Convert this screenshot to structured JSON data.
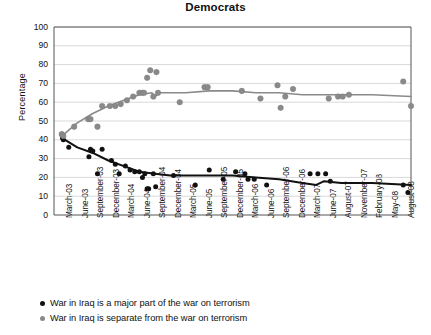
{
  "chart_data": {
    "type": "scatter",
    "title": "Democrats",
    "xlabel": "",
    "ylabel": "Percentage",
    "ylim": [
      0,
      100
    ],
    "ytick_step": 10,
    "yticks": [
      100,
      90,
      80,
      70,
      60,
      50,
      40,
      30,
      20,
      10,
      0
    ],
    "grid": true,
    "legend_position": "below",
    "categories": [
      "March-03",
      "June-03",
      "September-03",
      "December-03",
      "March-04",
      "June-04",
      "September-04",
      "December-04",
      "March-05",
      "June-05",
      "September-05",
      "December-05",
      "March-06",
      "June-06",
      "September-06",
      "December-06",
      "March-07",
      "June-07",
      "August-07",
      "November-07",
      "February-08",
      "May-08",
      "August-08"
    ],
    "series": [
      {
        "name": "War in Iraq is a major part of the war on terrorism",
        "color": "#111111",
        "marker": "circle",
        "points": [
          {
            "x": 0.0,
            "y": 43
          },
          {
            "x": 0.05,
            "y": 41
          },
          {
            "x": 0.1,
            "y": 40
          },
          {
            "x": 0.45,
            "y": 36
          },
          {
            "x": 1.75,
            "y": 31
          },
          {
            "x": 1.85,
            "y": 35
          },
          {
            "x": 2.0,
            "y": 34
          },
          {
            "x": 2.3,
            "y": 22
          },
          {
            "x": 2.6,
            "y": 35
          },
          {
            "x": 3.2,
            "y": 29
          },
          {
            "x": 3.45,
            "y": 27
          },
          {
            "x": 3.7,
            "y": 22
          },
          {
            "x": 4.1,
            "y": 26
          },
          {
            "x": 4.4,
            "y": 24
          },
          {
            "x": 4.7,
            "y": 23
          },
          {
            "x": 5.0,
            "y": 23
          },
          {
            "x": 5.2,
            "y": 20
          },
          {
            "x": 5.35,
            "y": 22
          },
          {
            "x": 5.5,
            "y": 14
          },
          {
            "x": 5.6,
            "y": 14
          },
          {
            "x": 5.9,
            "y": 22
          },
          {
            "x": 6.05,
            "y": 15
          },
          {
            "x": 7.2,
            "y": 21
          },
          {
            "x": 8.6,
            "y": 16
          },
          {
            "x": 9.5,
            "y": 24
          },
          {
            "x": 10.4,
            "y": 19
          },
          {
            "x": 11.2,
            "y": 23
          },
          {
            "x": 11.8,
            "y": 22
          },
          {
            "x": 12.0,
            "y": 19
          },
          {
            "x": 12.4,
            "y": 19
          },
          {
            "x": 13.2,
            "y": 16
          },
          {
            "x": 16.0,
            "y": 22
          },
          {
            "x": 16.5,
            "y": 22
          },
          {
            "x": 17.0,
            "y": 22
          },
          {
            "x": 17.3,
            "y": 18
          },
          {
            "x": 22.0,
            "y": 16
          },
          {
            "x": 22.3,
            "y": 12
          }
        ],
        "trend": [
          {
            "x": 0.0,
            "y": 41
          },
          {
            "x": 1.0,
            "y": 36
          },
          {
            "x": 2.0,
            "y": 33
          },
          {
            "x": 3.0,
            "y": 29
          },
          {
            "x": 4.0,
            "y": 26
          },
          {
            "x": 5.0,
            "y": 23
          },
          {
            "x": 6.0,
            "y": 22
          },
          {
            "x": 7.0,
            "y": 21
          },
          {
            "x": 8.0,
            "y": 21
          },
          {
            "x": 9.5,
            "y": 21
          },
          {
            "x": 11.0,
            "y": 21
          },
          {
            "x": 12.5,
            "y": 20
          },
          {
            "x": 14.0,
            "y": 19
          },
          {
            "x": 15.5,
            "y": 17
          },
          {
            "x": 16.4,
            "y": 16
          },
          {
            "x": 16.9,
            "y": 18
          },
          {
            "x": 18.0,
            "y": 17
          },
          {
            "x": 20.0,
            "y": 17
          },
          {
            "x": 22.5,
            "y": 16
          }
        ]
      },
      {
        "name": "War in Iraq is separate from the war on terrorism",
        "color": "#8a8a8a",
        "marker": "circle",
        "points": [
          {
            "x": 0.0,
            "y": 43
          },
          {
            "x": 0.1,
            "y": 42
          },
          {
            "x": 0.8,
            "y": 47
          },
          {
            "x": 1.7,
            "y": 51
          },
          {
            "x": 1.85,
            "y": 51
          },
          {
            "x": 2.3,
            "y": 47
          },
          {
            "x": 2.6,
            "y": 58
          },
          {
            "x": 3.1,
            "y": 58
          },
          {
            "x": 3.45,
            "y": 58
          },
          {
            "x": 3.8,
            "y": 59
          },
          {
            "x": 4.2,
            "y": 61
          },
          {
            "x": 4.6,
            "y": 63
          },
          {
            "x": 5.0,
            "y": 65
          },
          {
            "x": 5.2,
            "y": 65
          },
          {
            "x": 5.3,
            "y": 65
          },
          {
            "x": 5.5,
            "y": 73
          },
          {
            "x": 5.7,
            "y": 77
          },
          {
            "x": 5.9,
            "y": 63
          },
          {
            "x": 6.1,
            "y": 76
          },
          {
            "x": 6.2,
            "y": 65
          },
          {
            "x": 7.6,
            "y": 60
          },
          {
            "x": 9.2,
            "y": 68
          },
          {
            "x": 9.4,
            "y": 68
          },
          {
            "x": 11.6,
            "y": 66
          },
          {
            "x": 12.8,
            "y": 62
          },
          {
            "x": 13.9,
            "y": 69
          },
          {
            "x": 14.1,
            "y": 57
          },
          {
            "x": 14.4,
            "y": 63
          },
          {
            "x": 14.9,
            "y": 67
          },
          {
            "x": 17.2,
            "y": 62
          },
          {
            "x": 17.8,
            "y": 63
          },
          {
            "x": 18.1,
            "y": 63
          },
          {
            "x": 18.5,
            "y": 64
          },
          {
            "x": 22.0,
            "y": 71
          },
          {
            "x": 22.5,
            "y": 58
          }
        ],
        "trend": [
          {
            "x": 0.0,
            "y": 42
          },
          {
            "x": 1.0,
            "y": 49
          },
          {
            "x": 2.0,
            "y": 54
          },
          {
            "x": 3.0,
            "y": 58
          },
          {
            "x": 4.0,
            "y": 61
          },
          {
            "x": 5.0,
            "y": 64
          },
          {
            "x": 5.8,
            "y": 65
          },
          {
            "x": 6.0,
            "y": 63
          },
          {
            "x": 6.3,
            "y": 65
          },
          {
            "x": 8.0,
            "y": 65
          },
          {
            "x": 9.5,
            "y": 66
          },
          {
            "x": 11.0,
            "y": 66
          },
          {
            "x": 12.5,
            "y": 65
          },
          {
            "x": 14.0,
            "y": 65
          },
          {
            "x": 15.5,
            "y": 64
          },
          {
            "x": 17.0,
            "y": 64
          },
          {
            "x": 18.5,
            "y": 64
          },
          {
            "x": 20.0,
            "y": 64
          },
          {
            "x": 22.5,
            "y": 63
          }
        ]
      }
    ],
    "legend": [
      {
        "label": "War in Iraq is a major part of the war on terrorism",
        "color": "#111111"
      },
      {
        "label": "War in Iraq is separate from the war on terrorism",
        "color": "#8a8a8a"
      }
    ]
  }
}
